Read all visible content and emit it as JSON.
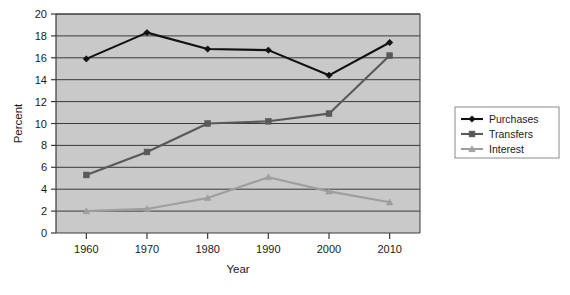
{
  "chart_data": {
    "type": "line",
    "title": "",
    "xlabel": "Year",
    "ylabel": "Percent",
    "categories": [
      "1960",
      "1970",
      "1980",
      "1990",
      "2000",
      "2010"
    ],
    "x": [
      1960,
      1970,
      1980,
      1990,
      2000,
      2010
    ],
    "xlim": [
      1955,
      2015
    ],
    "ylim": [
      0,
      20
    ],
    "ytick_labels": [
      "0",
      "2",
      "4",
      "6",
      "8",
      "10",
      "12",
      "14",
      "16",
      "18",
      "20"
    ],
    "yticks": [
      0,
      2,
      4,
      6,
      8,
      10,
      12,
      14,
      16,
      18,
      20
    ],
    "xtick_labels": [
      "1960",
      "1970",
      "1980",
      "1990",
      "2000",
      "2010"
    ],
    "grid": "horizontal",
    "legend_position": "right",
    "plot_background": "#c9c9c9",
    "series": [
      {
        "name": "Purchases",
        "values": [
          15.9,
          18.3,
          16.8,
          16.7,
          14.4,
          17.4
        ],
        "color": "#111111",
        "marker": "diamond"
      },
      {
        "name": "Transfers",
        "values": [
          5.3,
          7.4,
          10.0,
          10.2,
          10.9,
          16.2
        ],
        "color": "#595959",
        "marker": "square"
      },
      {
        "name": "Interest",
        "values": [
          2.0,
          2.2,
          3.2,
          5.1,
          3.8,
          2.8
        ],
        "color": "#9e9e9e",
        "marker": "triangle"
      }
    ]
  },
  "axes": {
    "y_title": "Percent",
    "x_title": "Year"
  },
  "legend": {
    "items": [
      {
        "label": "Purchases"
      },
      {
        "label": "Transfers"
      },
      {
        "label": "Interest"
      }
    ]
  }
}
